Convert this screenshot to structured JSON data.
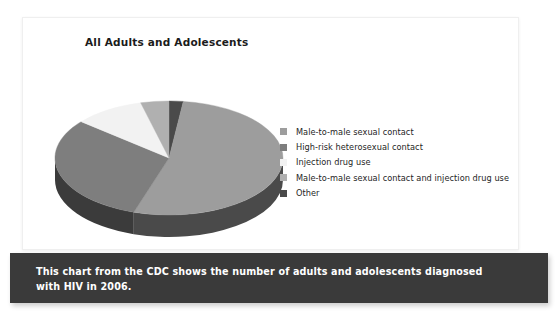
{
  "chart_panel": {
    "title": "All Adults and Adolescents"
  },
  "caption": {
    "text": "This chart from the CDC shows the number of adults and adolescents diagnosed with HIV in 2006."
  },
  "legend": {
    "items": [
      {
        "label": "Male-to-male sexual contact",
        "color": "#9d9d9d"
      },
      {
        "label": "High-risk heterosexual contact",
        "color": "#7e7e7e"
      },
      {
        "label": "Injection drug use",
        "color": "#f2f2f2"
      },
      {
        "label": "Male-to-male sexual contact and injection drug use",
        "color": "#b0b0b0"
      },
      {
        "label": "Other",
        "color": "#4a4a4a"
      }
    ]
  },
  "chart_data": {
    "type": "pie",
    "title": "All Adults and Adolescents",
    "subtitle": "",
    "xlabel": "",
    "ylabel": "",
    "legend_position": "right",
    "grid": false,
    "three_d": true,
    "start_angle_deg": 0,
    "direction": "clockwise",
    "categories": [
      "Other",
      "Male-to-male sexual contact",
      "High-risk heterosexual contact",
      "Injection drug use",
      "Male-to-male sexual contact and injection drug use"
    ],
    "values": [
      2,
      53,
      31,
      10,
      4
    ],
    "units": "percent",
    "colors": [
      "#4a4a4a",
      "#9d9d9d",
      "#7e7e7e",
      "#f2f2f2",
      "#b0b0b0"
    ],
    "slices": [
      {
        "label": "Other",
        "value": 2,
        "color": "#4a4a4a",
        "side_color": "#2f2f2f"
      },
      {
        "label": "Male-to-male sexual contact",
        "value": 53,
        "color": "#9d9d9d",
        "side_color": "#4a4a4a"
      },
      {
        "label": "High-risk heterosexual contact",
        "value": 31,
        "color": "#7e7e7e",
        "side_color": "#3b3b3b"
      },
      {
        "label": "Injection drug use",
        "value": 10,
        "color": "#f2f2f2",
        "side_color": "#9a9a9a"
      },
      {
        "label": "Male-to-male sexual contact and injection drug use",
        "value": 4,
        "color": "#b0b0b0",
        "side_color": "#6a6a6a"
      }
    ],
    "annotations": []
  }
}
